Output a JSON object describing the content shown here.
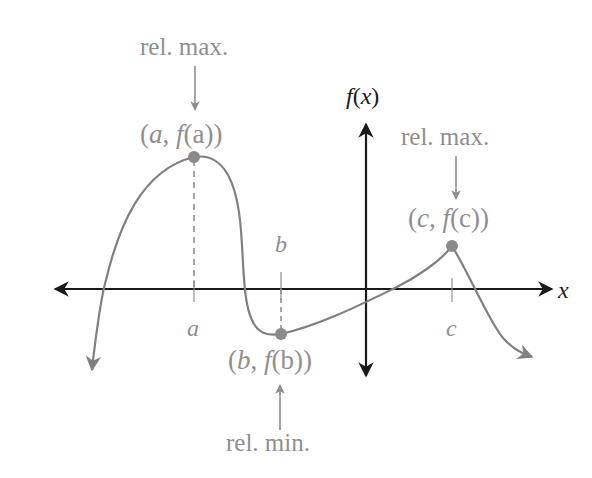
{
  "diagram": {
    "colors": {
      "axis": "#1a1a1a",
      "curve": "#808080",
      "annotation": "#8f8f8f",
      "point": "#8a8a8a",
      "background": "#ffffff"
    },
    "axes": {
      "x_label": "x",
      "y_label_f": "f",
      "y_label_paren_open": "(",
      "y_label_var": "x",
      "y_label_paren_close": ")"
    },
    "ticks": {
      "a": "a",
      "b": "b",
      "c": "c"
    },
    "points": [
      {
        "id": "a",
        "coords_label_open": "(",
        "coords_label_var": "a",
        "coords_label_sep": ", ",
        "coords_label_f": "f",
        "coords_label_inner": "(a)",
        "coords_label_close": ")",
        "annotation": "rel. max.",
        "kind": "relative maximum"
      },
      {
        "id": "b",
        "coords_label_open": "(",
        "coords_label_var": "b",
        "coords_label_sep": ", ",
        "coords_label_f": "f",
        "coords_label_inner": "(b)",
        "coords_label_close": ")",
        "annotation": "rel. min.",
        "kind": "relative minimum"
      },
      {
        "id": "c",
        "coords_label_open": "(",
        "coords_label_var": "c",
        "coords_label_sep": ", ",
        "coords_label_f": "f",
        "coords_label_inner": "(c)",
        "coords_label_close": ")",
        "annotation": "rel. max.",
        "kind": "relative maximum"
      }
    ]
  }
}
